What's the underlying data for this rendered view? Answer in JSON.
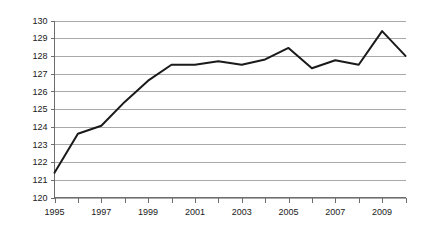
{
  "chart_data": {
    "type": "line",
    "title": "",
    "subtitle": "",
    "xlabel": "",
    "ylabel": "",
    "x": [
      1995,
      1996,
      1997,
      1998,
      1999,
      2000,
      2001,
      2002,
      2003,
      2004,
      2005,
      2006,
      2007,
      2008,
      2009,
      2010
    ],
    "categories": [
      "1995",
      "1996",
      "1997",
      "1998",
      "1999",
      "2000",
      "2001",
      "2002",
      "2003",
      "2004",
      "2005",
      "2006",
      "2007",
      "2008",
      "2009",
      "2010"
    ],
    "values": [
      121.4,
      123.6,
      124.05,
      125.4,
      126.6,
      127.5,
      127.5,
      127.7,
      127.5,
      127.8,
      128.45,
      127.3,
      127.75,
      127.5,
      129.4,
      128.0
    ],
    "series": [
      {
        "name": "",
        "values": [
          121.4,
          123.6,
          124.05,
          125.4,
          126.6,
          127.5,
          127.5,
          127.7,
          127.5,
          127.8,
          128.45,
          127.3,
          127.75,
          127.5,
          129.4,
          128.0
        ]
      }
    ],
    "xlim": [
      1995,
      2010
    ],
    "ylim": [
      120,
      130
    ],
    "y_ticks": [
      120,
      121,
      122,
      123,
      124,
      125,
      126,
      127,
      128,
      129,
      130
    ],
    "y_tick_labels": [
      "120",
      "121",
      "122",
      "123",
      "124",
      "125",
      "126",
      "127",
      "128",
      "129",
      "130"
    ],
    "x_ticks": [
      1995,
      1996,
      1997,
      1998,
      1999,
      2000,
      2001,
      2002,
      2003,
      2004,
      2005,
      2006,
      2007,
      2008,
      2009,
      2010
    ],
    "x_tick_labels": [
      "1995",
      "",
      "1997",
      "",
      "1999",
      "",
      "2001",
      "",
      "2003",
      "",
      "2005",
      "",
      "2007",
      "",
      "2009",
      ""
    ],
    "x_visible_labels": [
      "1995",
      "1997",
      "1999",
      "2001",
      "2003",
      "2005",
      "2007",
      "2009"
    ],
    "grid": true,
    "grid_axis": "y",
    "legend": false,
    "legend_position": "none",
    "annotations": [],
    "colors": {
      "line": "#1a1a1a",
      "gridline": "#a9a9a9",
      "axis": "#6e6e6e",
      "text": "#1a1a1a",
      "background": "#ffffff"
    }
  }
}
